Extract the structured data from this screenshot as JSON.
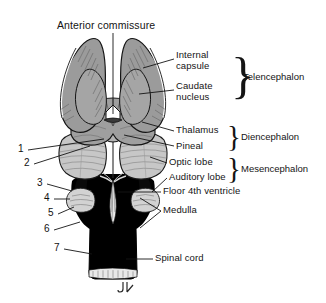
{
  "figure": {
    "title_label": "Anterior commissure",
    "signature": "JL",
    "background": "#ffffff",
    "ink_color": "#141414",
    "tissue_gray": "#9a9a9a",
    "tissue_light": "#c9c9c9",
    "tissue_dark": "#000000",
    "highlight": "#ffffff"
  },
  "callout_labels": [
    {
      "id": "internal-capsule",
      "text": "Internal\ncapsule",
      "line1": "Internal",
      "line2": "capsule",
      "x": 176,
      "y": 54
    },
    {
      "id": "caudate-nucleus",
      "text": "Caudate\nnucleus",
      "line1": "Caudate",
      "line2": "nucleus",
      "x": 176,
      "y": 85
    },
    {
      "id": "thalamus",
      "line1": "Thalamus",
      "x": 176,
      "y": 128
    },
    {
      "id": "pineal",
      "line1": "Pineal",
      "x": 176,
      "y": 143
    },
    {
      "id": "optic-lobe",
      "line1": "Optic lobe",
      "x": 169,
      "y": 160
    },
    {
      "id": "auditory-lobe",
      "line1": "Auditory lobe",
      "x": 169,
      "y": 175
    },
    {
      "id": "floor-4th-ventricle",
      "line1": "Floor 4th ventricle",
      "x": 163,
      "y": 189
    },
    {
      "id": "medulla",
      "line1": "Medulla",
      "x": 163,
      "y": 208
    },
    {
      "id": "spinal-cord",
      "line1": "Spinal cord",
      "x": 155,
      "y": 256
    }
  ],
  "group_labels": [
    {
      "id": "telencephalon",
      "text": "Telencephalon",
      "x": 248,
      "y": 76
    },
    {
      "id": "diencephalon",
      "text": "Diencephalon",
      "x": 242,
      "y": 136
    },
    {
      "id": "mesencephalon",
      "text": "Mesencephalon",
      "x": 242,
      "y": 168
    }
  ],
  "braces": [
    {
      "id": "telencephalon-brace",
      "x": 232,
      "y": 52,
      "height": 48
    },
    {
      "id": "diencephalon-brace",
      "x": 228,
      "y": 125,
      "height": 26
    },
    {
      "id": "mesencephalon-brace",
      "x": 228,
      "y": 157,
      "height": 26
    }
  ],
  "numbered_callouts": [
    {
      "number": "1",
      "x": 18,
      "y": 147
    },
    {
      "number": "2",
      "x": 24,
      "y": 161
    },
    {
      "number": "3",
      "x": 37,
      "y": 181
    },
    {
      "number": "4",
      "x": 44,
      "y": 196
    },
    {
      "number": "5",
      "x": 48,
      "y": 211
    },
    {
      "number": "6",
      "x": 44,
      "y": 227
    },
    {
      "number": "7",
      "x": 54,
      "y": 246
    }
  ]
}
